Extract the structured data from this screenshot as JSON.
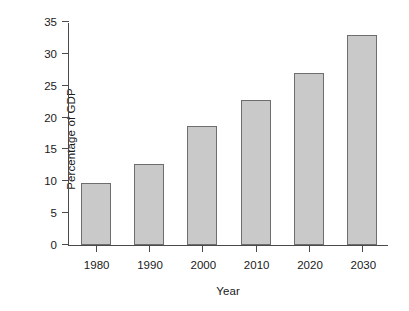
{
  "chart_data": {
    "type": "bar",
    "title": "",
    "subtitle": "",
    "xlabel": "Year",
    "ylabel": "Percentage of GDP",
    "categories": [
      "1980",
      "1990",
      "2000",
      "2010",
      "2020",
      "2030"
    ],
    "values": [
      9.7,
      12.7,
      18.7,
      22.7,
      27.0,
      33.0
    ],
    "series": [
      {
        "name": "Percentage of GDP",
        "values": [
          9.7,
          12.7,
          18.7,
          22.7,
          27.0,
          33.0
        ]
      }
    ],
    "ylim": [
      0,
      35
    ],
    "yticks": [
      0,
      5,
      10,
      15,
      20,
      25,
      30,
      35
    ],
    "ytick_labels": [
      "0",
      "5",
      "10",
      "15",
      "20",
      "25",
      "30",
      "35"
    ],
    "xtick_labels": [
      "1980",
      "1990",
      "2000",
      "2010",
      "2020",
      "2030"
    ],
    "grid": false,
    "legend": false,
    "legend_position": "none",
    "colors": {
      "bar_fill": "#c9c9c9",
      "bar_border": "#6e6e6e",
      "axis": "#4a4a4a",
      "text": "#1a1a1a",
      "background": "#ffffff"
    }
  }
}
